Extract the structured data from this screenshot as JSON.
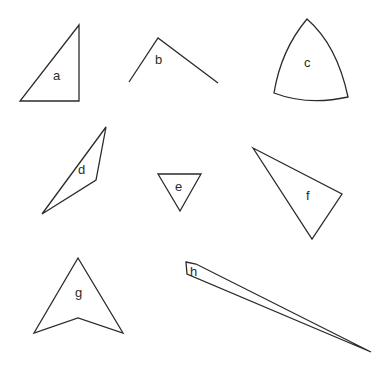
{
  "figure": {
    "width": 389,
    "height": 372,
    "stroke_color": "#2b2b2b",
    "background": "#ffffff",
    "shapes": [
      {
        "id": "a",
        "label": "a",
        "kind": "right-triangle",
        "closed": true,
        "points": "20,101 79,101 79,25",
        "label_x": 53,
        "label_y": 80
      },
      {
        "id": "b",
        "label": "b",
        "kind": "open-angle",
        "closed": false,
        "points": "129,82 158,38 218,83",
        "label_x": 155,
        "label_y": 64
      },
      {
        "id": "c",
        "label": "c",
        "kind": "curved-triangle",
        "closed": true,
        "path": "M 307,19 Q 281,50 274,93 Q 308,106 348,97 Q 337,45 307,19 Z",
        "label_x": 304,
        "label_y": 67
      },
      {
        "id": "d",
        "label": "d",
        "kind": "concave-quadrilateral",
        "closed": true,
        "points": "42,214 106,127 96,180",
        "label_x": 78,
        "label_y": 174
      },
      {
        "id": "e",
        "label": "e",
        "kind": "inverted-triangle",
        "closed": true,
        "points": "158,174 201,174 180,211",
        "label_x": 175,
        "label_y": 191
      },
      {
        "id": "f",
        "label": "f",
        "kind": "scalene-triangle",
        "closed": true,
        "points": "253,148 342,194 312,239",
        "label_x": 306,
        "label_y": 200
      },
      {
        "id": "g",
        "label": "g",
        "kind": "arrowhead",
        "closed": true,
        "points": "78,258 123,333 78,318 34,333",
        "label_x": 75,
        "label_y": 297
      },
      {
        "id": "h",
        "label": "h",
        "kind": "thin-sliver",
        "closed": true,
        "points": "186,262 196,264 371,352 187,274",
        "label_x": 190,
        "label_y": 276
      }
    ]
  }
}
